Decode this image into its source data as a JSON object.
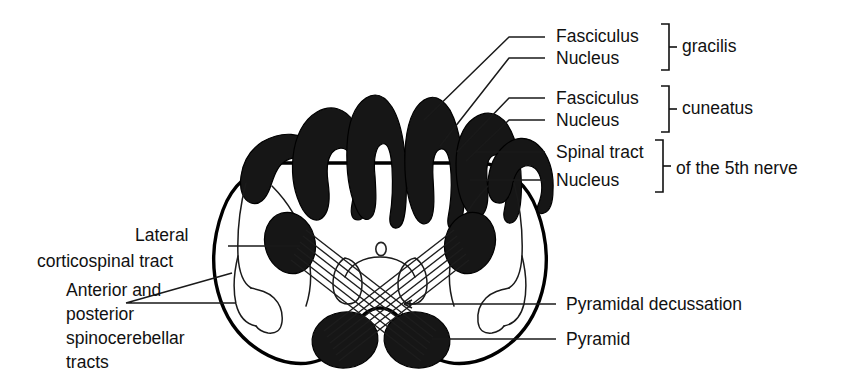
{
  "figure": {
    "title": "Transverse section of the medulla oblongata at the level of the decussation of the pyramids",
    "canal_glyph": "o"
  },
  "labels_right": [
    {
      "id": "fasciculus-gracilis",
      "text": "Fasciculus",
      "x": 556,
      "y": 42,
      "leader": "M 545,37 L 509,37 L 424,120"
    },
    {
      "id": "nucleus-gracilis",
      "text": "Nucleus",
      "x": 556,
      "y": 64,
      "leader": "M 545,58 L 509,58 L 440,146"
    },
    {
      "id": "fasciculus-cuneatus",
      "text": "Fasciculus",
      "x": 556,
      "y": 104,
      "leader": "M 545,98 L 509,98 L 457,152"
    },
    {
      "id": "nucleus-cuneatus",
      "text": "Nucleus",
      "x": 556,
      "y": 126,
      "leader": "M 545,120 L 509,120 L 466,161"
    },
    {
      "id": "spinal-tract-5th",
      "text": "Spinal tract",
      "x": 556,
      "y": 158,
      "leader": "M 545,152 L 475,152"
    },
    {
      "id": "nucleus-spinal-5th",
      "text": "Nucleus",
      "x": 556,
      "y": 186,
      "leader": "M 545,180 L 470,180"
    },
    {
      "id": "pyramidal-decussation",
      "text": "Pyramidal decussation",
      "x": 566,
      "y": 310,
      "leader": "M 556,304 L 404,304",
      "arrow": true
    },
    {
      "id": "pyramid",
      "text": "Pyramid",
      "x": 566,
      "y": 345,
      "leader": "M 556,339 L 432,339"
    }
  ],
  "brace_groups": [
    {
      "id": "gracilis-brace",
      "label": "gracilis",
      "label_x": 682,
      "label_y": 52,
      "bracket": "M 661,24 L 669,24 L 669,70 L 661,70",
      "tick": "M 669,47 L 677,47"
    },
    {
      "id": "cuneatus-brace",
      "label": "cuneatus",
      "label_x": 682,
      "label_y": 114,
      "bracket": "M 661,86 L 669,86 L 669,132 L 661,132",
      "tick": "M 669,109 L 677,109"
    },
    {
      "id": "fifth-nerve-brace",
      "label": "of the 5th nerve",
      "label_x": 676,
      "label_y": 174,
      "bracket": "M 655,140 L 663,140 L 663,192 L 655,192",
      "tick": "M 663,166 L 671,166"
    }
  ],
  "labels_left": [
    {
      "id": "lateral-corticospinal-tract",
      "lines": [
        "Lateral",
        "corticospinal tract"
      ],
      "line_x": [
        135,
        37
      ],
      "line_y": [
        241,
        267
      ],
      "leader": "M 228,246 L 300,246"
    },
    {
      "id": "anterior-posterior-spinocerebellar-tracts",
      "lines": [
        "Anterior and",
        "posterior",
        "spinocerebellar",
        "tracts"
      ],
      "line_x": [
        66,
        66,
        66,
        66
      ],
      "line_y": [
        296,
        320,
        344,
        368
      ],
      "leader": "M 126,303 L 232,273 M 126,303 L 236,303"
    }
  ],
  "colors": {
    "ink": "#000000",
    "dark_mass": "#161616",
    "leader": "#1a1a1a",
    "background": "#ffffff"
  }
}
